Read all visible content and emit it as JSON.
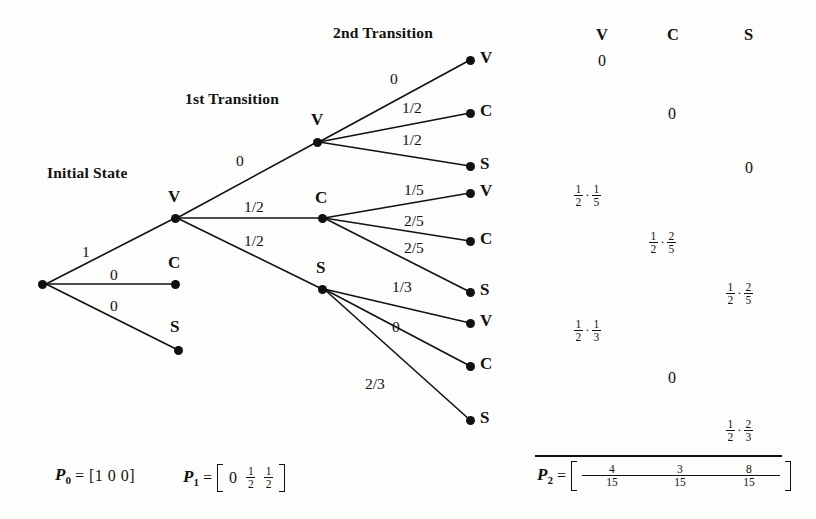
{
  "figure": {
    "type": "probability-tree-diagram",
    "headings": {
      "initial_state": "Initial State",
      "first_transition": "1st Transition",
      "second_transition": "2nd Transition"
    }
  },
  "tree": {
    "root": {
      "label": "",
      "x": 42,
      "y": 284
    },
    "level1": [
      {
        "state": "V",
        "prob": "1",
        "x": 175,
        "y": 218
      },
      {
        "state": "C",
        "prob": "0",
        "x": 175,
        "y": 284
      },
      {
        "state": "S",
        "prob": "0",
        "x": 175,
        "y": 349
      }
    ],
    "level2_from_V": [
      {
        "state": "V",
        "prob": "0",
        "x": 317,
        "y": 142
      },
      {
        "state": "C",
        "prob": "1/2",
        "x": 322,
        "y": 218
      },
      {
        "state": "S",
        "prob": "1/2",
        "x": 322,
        "y": 289
      }
    ],
    "level3": [
      {
        "parent": "V",
        "state": "V",
        "prob": "0",
        "x": 470,
        "y": 60
      },
      {
        "parent": "V",
        "state": "C",
        "prob": "1/2",
        "x": 470,
        "y": 113
      },
      {
        "parent": "V",
        "state": "S",
        "prob": "1/2",
        "x": 470,
        "y": 166
      },
      {
        "parent": "C",
        "state": "V",
        "prob": "1/5",
        "x": 470,
        "y": 193
      },
      {
        "parent": "C",
        "state": "C",
        "prob": "2/5",
        "x": 470,
        "y": 241
      },
      {
        "parent": "C",
        "state": "S",
        "prob": "2/5",
        "x": 470,
        "y": 292
      },
      {
        "parent": "S",
        "state": "V",
        "prob": "1/3",
        "x": 470,
        "y": 323
      },
      {
        "parent": "S",
        "state": "C",
        "prob": "0",
        "x": 470,
        "y": 366
      },
      {
        "parent": "S",
        "state": "S",
        "prob": "2/3",
        "x": 470,
        "y": 420
      }
    ]
  },
  "edge_labels": {
    "root_to_V": "1",
    "root_to_C": "0",
    "root_to_S": "0",
    "V_to_V": "0",
    "V_to_C": "1/2",
    "V_to_S": "1/2",
    "VV": "0",
    "VC": "1/2",
    "VS": "1/2",
    "CV": "1/5",
    "CC": "2/5",
    "CS": "2/5",
    "SV": "1/3",
    "SC": "0",
    "SS": "2/3"
  },
  "table": {
    "columns": [
      "V",
      "C",
      "S"
    ],
    "rows": [
      {
        "col": "V",
        "kind": "zero",
        "value": "0"
      },
      {
        "col": "C",
        "kind": "zero",
        "value": "0"
      },
      {
        "col": "S",
        "kind": "zero",
        "value": "0"
      },
      {
        "col": "V",
        "kind": "product",
        "a_num": "1",
        "a_den": "2",
        "b_num": "1",
        "b_den": "5"
      },
      {
        "col": "C",
        "kind": "product",
        "a_num": "1",
        "a_den": "2",
        "b_num": "2",
        "b_den": "5"
      },
      {
        "col": "S",
        "kind": "product",
        "a_num": "1",
        "a_den": "2",
        "b_num": "2",
        "b_den": "5"
      },
      {
        "col": "V",
        "kind": "product",
        "a_num": "1",
        "a_den": "2",
        "b_num": "1",
        "b_den": "3"
      },
      {
        "col": "C",
        "kind": "zero",
        "value": "0"
      },
      {
        "col": "S",
        "kind": "product",
        "a_num": "1",
        "a_den": "2",
        "b_num": "2",
        "b_den": "3"
      }
    ]
  },
  "vectors": {
    "p0": {
      "name": "P",
      "sub": "0",
      "eq": "=",
      "open": "[",
      "close": "]",
      "entries": [
        "1",
        "0",
        "0"
      ],
      "inline": "[1 0 0]"
    },
    "p1": {
      "name": "P",
      "sub": "1",
      "eq": "=",
      "entries": [
        {
          "kind": "int",
          "value": "0"
        },
        {
          "kind": "frac",
          "num": "1",
          "den": "2"
        },
        {
          "kind": "frac",
          "num": "1",
          "den": "2"
        }
      ]
    },
    "p2": {
      "name": "P",
      "sub": "2",
      "eq": "=",
      "entries": [
        {
          "kind": "frac",
          "num": "4",
          "den": "15"
        },
        {
          "kind": "frac",
          "num": "3",
          "den": "15"
        },
        {
          "kind": "frac",
          "num": "8",
          "den": "15"
        }
      ]
    }
  },
  "colors": {
    "ink": "#111111",
    "paper": "#fdfdfb"
  }
}
